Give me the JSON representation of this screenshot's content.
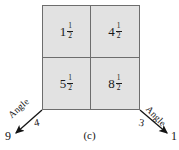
{
  "figure": {
    "caption": "(c)",
    "fill_color": "#e2e2e2",
    "border_color": "#6d6d6d",
    "text_color": "#141414"
  },
  "grid": {
    "rows": 2,
    "columns": 2,
    "cells": [
      {
        "position": "top-left",
        "value": "1 1/2",
        "whole": "1",
        "numerator": "1",
        "denominator": "2"
      },
      {
        "position": "top-right",
        "value": "4 1/2",
        "whole": "4",
        "numerator": "1",
        "denominator": "2"
      },
      {
        "position": "bottom-left",
        "value": "5 1/2",
        "whole": "5",
        "numerator": "1",
        "denominator": "2"
      },
      {
        "position": "bottom-right",
        "value": "8 1/2",
        "whole": "8",
        "numerator": "1",
        "denominator": "2"
      }
    ]
  },
  "annotations": {
    "left_angle": {
      "label": "Angle",
      "inner_number": "4",
      "outer_number": "9"
    },
    "right_angle": {
      "label": "Angle",
      "inner_number": "3",
      "outer_number": "1"
    }
  }
}
